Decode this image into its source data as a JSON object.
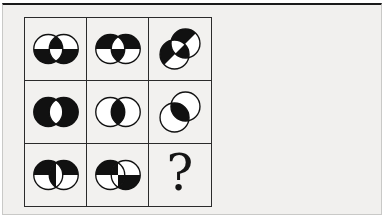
{
  "page": {
    "background_color": "#f1f0ee",
    "top_rule_color": "#1a1a1a",
    "frame_color": "#c9c9c7"
  },
  "puzzle": {
    "title": "matrix-reasoning-puzzle-3x3",
    "grid_rows": 3,
    "grid_cols": 3,
    "grid_line_color": "#2b2b2b",
    "shape_color": "#111111",
    "shape_fill_background": "#ffffff",
    "question_mark": "?",
    "cells": [
      {
        "id": "r1c1",
        "type": "venn",
        "left": "bottom",
        "right": "bottom",
        "lens": "top",
        "rotation": 0,
        "description": "two overlapping circles, bottom halves black, overlap lens inverted (top of lens black, bottom white)"
      },
      {
        "id": "r1c2",
        "type": "venn",
        "left": "top",
        "right": "top",
        "lens": "bottom",
        "rotation": 0,
        "description": "two overlapping circles, top halves black, overlap lens inverted (top of lens white, bottom black)"
      },
      {
        "id": "r1c3",
        "type": "venn",
        "left": "top",
        "right": "top",
        "lens": "bottom",
        "rotation": -45,
        "description": "same as r1c2 rotated 45 degrees counterclockwise, circles on a SW-NE diagonal"
      },
      {
        "id": "r2c1",
        "type": "venn",
        "left": "full",
        "right": "full",
        "lens": "none",
        "rotation": 0,
        "description": "two overlapping circles fully black with white overlap lens"
      },
      {
        "id": "r2c2",
        "type": "venn",
        "left": "none",
        "right": "none",
        "lens": "full",
        "rotation": 0,
        "description": "two outlined white circles with black overlap lens"
      },
      {
        "id": "r2c3",
        "type": "venn",
        "left": "none",
        "right": "none",
        "lens": "full",
        "rotation": -45,
        "description": "same as r2c2 rotated 45 degrees counterclockwise, circles on a SW-NE diagonal"
      },
      {
        "id": "r3c1",
        "type": "venn",
        "left": "top",
        "right": "top",
        "lens": "left",
        "rotation": 0,
        "description": "two overlapping circles, top halves black, lens left half black and right half white"
      },
      {
        "id": "r3c2",
        "type": "venn",
        "left": "top",
        "right": "bottom",
        "lens": "tl-br",
        "rotation": 0,
        "description": "quadrant pinwheel: left circle top black, right circle bottom black, lens checkered top-left and bottom-right black"
      },
      {
        "id": "r3c3",
        "type": "question",
        "description": "empty answer cell containing a question mark"
      }
    ]
  }
}
